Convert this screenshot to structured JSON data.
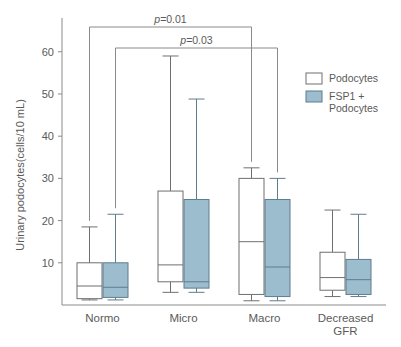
{
  "chart_data": {
    "type": "box",
    "title": "",
    "xlabel": "",
    "ylabel": "Urinary podocytes(cells/10 mL)",
    "ylim": [
      0,
      68
    ],
    "yticks": [
      10,
      20,
      30,
      40,
      50,
      60
    ],
    "ytick_labels": [
      "10",
      "20",
      "30",
      "40",
      "50",
      "60"
    ],
    "grid": false,
    "categories": [
      "Normo",
      "Micro",
      "Macro",
      "Decreased GFR"
    ],
    "category_labels": [
      [
        "Normo"
      ],
      [
        "Micro"
      ],
      [
        "Macro"
      ],
      [
        "Decreased",
        "GFR"
      ]
    ],
    "legend_position": "right",
    "series": [
      {
        "name": "Podocytes",
        "fill": "#ffffff",
        "stroke": "#6f6f6f",
        "boxes": [
          {
            "category": "Normo",
            "whisker_low": 1.2,
            "q1": 1.5,
            "median": 4.5,
            "q3": 10.0,
            "whisker_high": 18.5
          },
          {
            "category": "Micro",
            "whisker_low": 3.0,
            "q1": 5.5,
            "median": 9.5,
            "q3": 27.0,
            "whisker_high": 59.0
          },
          {
            "category": "Macro",
            "whisker_low": 1.0,
            "q1": 2.5,
            "median": 15.0,
            "q3": 30.0,
            "whisker_high": 32.5
          },
          {
            "category": "Decreased GFR",
            "whisker_low": 2.0,
            "q1": 3.5,
            "median": 6.5,
            "q3": 12.5,
            "whisker_high": 22.5
          }
        ]
      },
      {
        "name": "FSP1 + Podocytes",
        "fill": "#9cbdce",
        "stroke": "#5f7d8c",
        "boxes": [
          {
            "category": "Normo",
            "whisker_low": 1.2,
            "q1": 1.8,
            "median": 4.2,
            "q3": 10.0,
            "whisker_high": 21.5
          },
          {
            "category": "Micro",
            "whisker_low": 3.0,
            "q1": 4.0,
            "median": 5.5,
            "q3": 25.0,
            "whisker_high": 48.8
          },
          {
            "category": "Macro",
            "whisker_low": 1.0,
            "q1": 2.0,
            "median": 9.0,
            "q3": 25.0,
            "whisker_high": 30.0
          },
          {
            "category": "Decreased GFR",
            "whisker_low": 2.0,
            "q1": 2.5,
            "median": 6.0,
            "q3": 10.8,
            "whisker_high": 21.5
          }
        ]
      }
    ],
    "annotations": [
      {
        "id": "p-bracket-upper",
        "text": "p=0.01",
        "from": "Normo/Podocytes",
        "to": "Macro/Podocytes"
      },
      {
        "id": "p-bracket-lower",
        "text": "p=0.03",
        "from": "Normo/FSP1 + Podocytes",
        "to": "Macro/FSP1 + Podocytes"
      }
    ]
  },
  "legend": {
    "items": [
      {
        "label": "Podocytes",
        "swatch": "#ffffff"
      },
      {
        "label": "FSP1 +",
        "swatch": "#9cbdce"
      },
      {
        "label": "Podocytes",
        "swatch": null
      }
    ]
  },
  "annotations": {
    "p_upper": "p=0.01",
    "p_lower": "p=0.03"
  },
  "colors": {
    "series_fsp1": "#9cbdce",
    "series_podocytes": "#ffffff",
    "axis": "#8a8a8a",
    "text": "#5a5a5a"
  }
}
